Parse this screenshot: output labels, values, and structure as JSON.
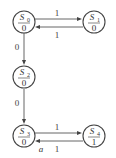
{
  "diagram": {
    "type": "state-machine",
    "states": [
      {
        "id": "S0",
        "name": "S",
        "sub": "0",
        "output": "0"
      },
      {
        "id": "S1",
        "name": "S",
        "sub": "1",
        "output": "0"
      },
      {
        "id": "S2",
        "name": "S",
        "sub": "2",
        "output": "0"
      },
      {
        "id": "S3",
        "name": "S",
        "sub": "3",
        "output": "0"
      },
      {
        "id": "S4",
        "name": "S",
        "sub": "4",
        "output": "1"
      }
    ],
    "transitions": [
      {
        "from": "S0",
        "to": "S1",
        "label": "1"
      },
      {
        "from": "S1",
        "to": "S0",
        "label": "1"
      },
      {
        "from": "S0",
        "to": "S2",
        "label": "0"
      },
      {
        "from": "S2",
        "to": "S3",
        "label": "0"
      },
      {
        "from": "S3",
        "to": "S4",
        "label": "1"
      },
      {
        "from": "S4",
        "to": "S3",
        "label": "1"
      }
    ],
    "caption": "a"
  }
}
